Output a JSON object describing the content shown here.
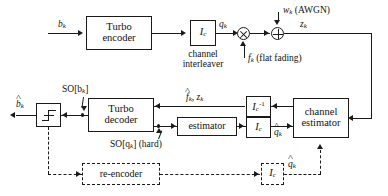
{
  "figure": {
    "type": "block-diagram"
  },
  "blocks": {
    "turbo_encoder": "Turbo\nencoder",
    "turbo_encoder_line1": "Turbo",
    "turbo_encoder_line2": "encoder",
    "channel_interleaver_box": "I",
    "channel_interleaver_box_sub": "c",
    "channel_interleaver_caption_line1": "channel",
    "channel_interleaver_caption_line2": "interleaver",
    "turbo_decoder_line1": "Turbo",
    "turbo_decoder_line2": "decoder",
    "estimator": "estimator",
    "deinterleaver_box": "I",
    "deinterleaver_box_sub": "c",
    "deinterleaver_box_sup": "-1",
    "interleaver_box2": "I",
    "interleaver_box2_sub": "c",
    "channel_estimator_line1": "channel",
    "channel_estimator_line2": "estimator",
    "re_encoder": "re-encoder",
    "interleaver_box3": "I",
    "interleaver_box3_sub": "c",
    "slicer": "hard-decision-threshold"
  },
  "signals": {
    "b_k": "b",
    "b_k_sub": "k",
    "q_k": "q",
    "q_k_sub": "k",
    "w_k": "w",
    "w_k_sub": "k",
    "awgn": "(AWGN)",
    "z_k": "z",
    "z_k_sub": "k",
    "f_k": "f",
    "f_k_sub": "k",
    "flat_fading": "(flat fading)",
    "b_hat_k": "b",
    "b_hat_k_sub": "k",
    "so_bk": "SO[b",
    "so_bk_sub": "k",
    "so_bk_close": "]",
    "f_hat_z_k": "f",
    "f_hat_z_k_sub": "k",
    "f_hat_z_k_mid": ", z",
    "f_hat_z_k_sub2": "k",
    "so_qk": "SO[q",
    "so_qk_sub": "k",
    "so_qk_close": "] (hard)",
    "q_hat_k_upper": "q",
    "q_hat_k_upper_sub": "k",
    "q_hat_k_lower": "q",
    "q_hat_k_lower_sub": "k"
  },
  "colors": {
    "stroke": "#1a1a1a",
    "background": "#ffffff"
  }
}
